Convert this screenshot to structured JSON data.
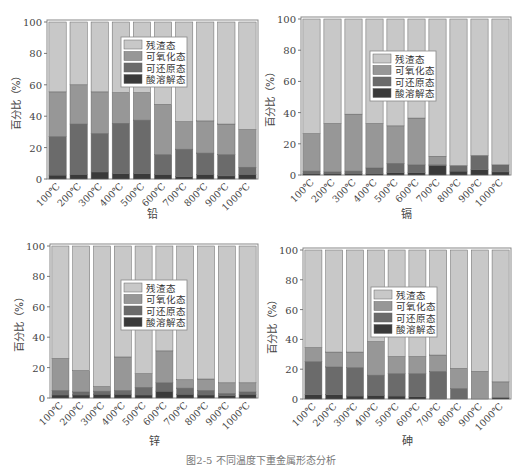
{
  "caption": "图2-5  不同温度下重金属形态分析",
  "chart_data": [
    {
      "type": "bar",
      "stacked": true,
      "title": "铅",
      "xlabel": "",
      "ylabel": "百分比（%）",
      "ylim": [
        0,
        100
      ],
      "yticks": [
        0,
        20,
        40,
        60,
        80,
        100
      ],
      "grid": false,
      "legend_position": "upper center",
      "categories": [
        "100℃",
        "200℃",
        "300℃",
        "400℃",
        "500℃",
        "600℃",
        "700℃",
        "800℃",
        "900℃",
        "1000℃"
      ],
      "series": [
        {
          "name": "酸溶解态",
          "color": "#3a3a3a",
          "values": [
            2.5,
            3,
            4.5,
            3.5,
            3.5,
            3,
            1.5,
            3,
            2,
            3
          ]
        },
        {
          "name": "可还原态",
          "color": "#6b6b6b",
          "values": [
            24.5,
            32,
            24.5,
            32,
            34,
            12.5,
            17.5,
            13.5,
            13.5,
            4.5
          ]
        },
        {
          "name": "可氧化态",
          "color": "#979797",
          "values": [
            28.5,
            25,
            26.5,
            19.5,
            17.5,
            32,
            17.5,
            20.5,
            19.5,
            24
          ]
        },
        {
          "name": "残渣态",
          "color": "#c8c8c8",
          "values": [
            44.5,
            40,
            44.5,
            45,
            45,
            52.5,
            63.5,
            63,
            65,
            68.5
          ]
        }
      ]
    },
    {
      "type": "bar",
      "stacked": true,
      "title": "镉",
      "xlabel": "",
      "ylabel": "百分比（%）",
      "ylim": [
        0,
        100
      ],
      "yticks": [
        0,
        20,
        40,
        60,
        80,
        100
      ],
      "grid": false,
      "legend_position": "center",
      "categories": [
        "100℃",
        "200℃",
        "300℃",
        "400℃",
        "500℃",
        "600℃",
        "700℃",
        "800℃",
        "900℃",
        "1000℃"
      ],
      "series": [
        {
          "name": "酸溶解态",
          "color": "#3a3a3a",
          "values": [
            1,
            1,
            1,
            1,
            1.5,
            1.5,
            6,
            2.5,
            3.5,
            2
          ]
        },
        {
          "name": "可还原态",
          "color": "#6b6b6b",
          "values": [
            1.5,
            1,
            1.5,
            3.5,
            6,
            5,
            0.5,
            3.5,
            9,
            4.5
          ]
        },
        {
          "name": "可氧化态",
          "color": "#979797",
          "values": [
            24,
            31,
            36.5,
            28.5,
            24,
            30,
            5.5,
            0,
            0,
            0
          ]
        },
        {
          "name": "残渣态",
          "color": "#c8c8c8",
          "values": [
            73.5,
            67,
            61,
            67,
            68.5,
            63.5,
            88,
            94,
            87.5,
            93.5
          ]
        }
      ]
    },
    {
      "type": "bar",
      "stacked": true,
      "title": "锌",
      "xlabel": "",
      "ylabel": "百分比（%）",
      "ylim": [
        0,
        100
      ],
      "yticks": [
        0,
        20,
        40,
        60,
        80,
        100
      ],
      "grid": false,
      "legend_position": "center",
      "categories": [
        "100℃",
        "200℃",
        "300℃",
        "400℃",
        "500℃",
        "600℃",
        "700℃",
        "800℃",
        "900℃",
        "1000℃"
      ],
      "series": [
        {
          "name": "酸溶解态",
          "color": "#3a3a3a",
          "values": [
            2,
            2,
            2.5,
            2.5,
            2,
            4.5,
            2.5,
            2,
            1.5,
            2.5
          ]
        },
        {
          "name": "可还原态",
          "color": "#6b6b6b",
          "values": [
            3,
            2,
            2,
            2.5,
            5,
            5.5,
            4,
            3,
            1.5,
            1.5
          ]
        },
        {
          "name": "可氧化态",
          "color": "#979797",
          "values": [
            21,
            14,
            3,
            22,
            9,
            21,
            5.5,
            7.5,
            7,
            6
          ]
        },
        {
          "name": "残渣态",
          "color": "#c8c8c8",
          "values": [
            74,
            82,
            92.5,
            73,
            84,
            69,
            88,
            87.5,
            90,
            90
          ]
        }
      ]
    },
    {
      "type": "bar",
      "stacked": true,
      "title": "砷",
      "xlabel": "",
      "ylabel": "百分比（%）",
      "ylim": [
        0,
        100
      ],
      "yticks": [
        0,
        20,
        40,
        60,
        80,
        100
      ],
      "grid": false,
      "legend_position": "center",
      "categories": [
        "100℃",
        "200℃",
        "300℃",
        "400℃",
        "500℃",
        "600℃",
        "700℃",
        "800℃",
        "900℃",
        "1000℃"
      ],
      "series": [
        {
          "name": "酸溶解态",
          "color": "#3a3a3a",
          "values": [
            3,
            3,
            2,
            2.5,
            2,
            1.5,
            0,
            0,
            0,
            1
          ]
        },
        {
          "name": "可还原态",
          "color": "#6b6b6b",
          "values": [
            22,
            18.5,
            19,
            13.5,
            15,
            15.5,
            18.5,
            7,
            0,
            0
          ]
        },
        {
          "name": "可氧化态",
          "color": "#979797",
          "values": [
            9.5,
            10,
            10.5,
            22.5,
            11.5,
            11.5,
            11,
            13.5,
            18.5,
            10.5
          ]
        },
        {
          "name": "残渣态",
          "color": "#c8c8c8",
          "values": [
            65.5,
            68.5,
            68.5,
            61.5,
            71.5,
            71.5,
            70.5,
            79.5,
            81.5,
            88.5
          ]
        }
      ]
    }
  ],
  "layout": {
    "panels": [
      {
        "left": 0,
        "top": 0,
        "plot": {
          "x0": 47,
          "x1": 258,
          "y0": 22,
          "y1": 179
        },
        "legend": {
          "x": 121,
          "y": 37
        },
        "title_y": 218
      },
      {
        "left": 261,
        "top": 0,
        "plot": {
          "x0": 40,
          "x1": 250,
          "y0": 19,
          "y1": 175
        },
        "legend": {
          "x": 109,
          "y": 51
        },
        "title_y": 218
      },
      {
        "left": 0,
        "top": 232,
        "plot": {
          "x0": 50,
          "x1": 258,
          "y0": 14,
          "y1": 166
        },
        "legend": {
          "x": 121,
          "y": 48
        },
        "title_y": 213
      },
      {
        "left": 261,
        "top": 232,
        "plot": {
          "x0": 42,
          "x1": 250,
          "y0": 18,
          "y1": 167
        },
        "legend": {
          "x": 110,
          "y": 55
        },
        "title_y": 213
      }
    ]
  }
}
